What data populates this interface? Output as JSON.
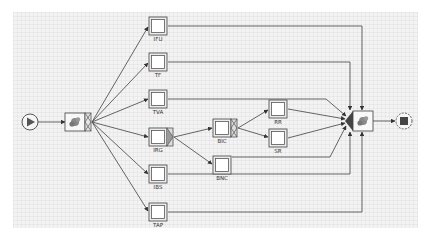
{
  "diagram": {
    "type": "workflow-net",
    "colors": {
      "canvas": "#f3f3f3",
      "stroke": "#555555",
      "task_fill": "#ffffff",
      "gear": "#777777"
    },
    "start": {
      "id": "start",
      "icon": "play-icon",
      "x": 30,
      "y": 122
    },
    "end": {
      "id": "end",
      "icon": "stop-icon",
      "x": 404,
      "y": 121
    },
    "split_node": {
      "id": "split",
      "icon": "gear-icon",
      "x": 76,
      "y": 122,
      "split": "and"
    },
    "join_node": {
      "id": "join",
      "icon": "gear-icon",
      "x": 363,
      "y": 121,
      "join": "xor"
    },
    "tasks": [
      {
        "id": "IFU",
        "label": "IFU",
        "x": 158,
        "y": 26,
        "split": null
      },
      {
        "id": "TF",
        "label": "TF",
        "x": 158,
        "y": 62,
        "split": null
      },
      {
        "id": "TVA",
        "label": "TVA",
        "x": 158,
        "y": 99,
        "split": null
      },
      {
        "id": "IRG",
        "label": "IRG",
        "x": 158,
        "y": 137,
        "split": "xor"
      },
      {
        "id": "IBS",
        "label": "IBS",
        "x": 158,
        "y": 174,
        "split": null
      },
      {
        "id": "TAP",
        "label": "TAP",
        "x": 158,
        "y": 212,
        "split": null
      },
      {
        "id": "BIC",
        "label": "BIC",
        "x": 222,
        "y": 128,
        "split": "and"
      },
      {
        "id": "BNC",
        "label": "BNC",
        "x": 222,
        "y": 165,
        "split": null
      },
      {
        "id": "RR",
        "label": "RR",
        "x": 278,
        "y": 109,
        "split": null
      },
      {
        "id": "SR",
        "label": "SR",
        "x": 278,
        "y": 138,
        "split": null
      }
    ],
    "flows": [
      {
        "from": "start",
        "to": "split"
      },
      {
        "from": "split",
        "to": "IFU"
      },
      {
        "from": "split",
        "to": "TF"
      },
      {
        "from": "split",
        "to": "TVA"
      },
      {
        "from": "split",
        "to": "IRG"
      },
      {
        "from": "split",
        "to": "IBS"
      },
      {
        "from": "split",
        "to": "TAP"
      },
      {
        "from": "IRG",
        "to": "BIC"
      },
      {
        "from": "IRG",
        "to": "BNC"
      },
      {
        "from": "BIC",
        "to": "RR"
      },
      {
        "from": "BIC",
        "to": "SR"
      },
      {
        "from": "IFU",
        "to": "join"
      },
      {
        "from": "TF",
        "to": "join"
      },
      {
        "from": "TVA",
        "to": "join"
      },
      {
        "from": "RR",
        "to": "join"
      },
      {
        "from": "SR",
        "to": "join"
      },
      {
        "from": "BNC",
        "to": "join"
      },
      {
        "from": "IBS",
        "to": "join"
      },
      {
        "from": "TAP",
        "to": "join"
      },
      {
        "from": "join",
        "to": "end"
      }
    ]
  }
}
